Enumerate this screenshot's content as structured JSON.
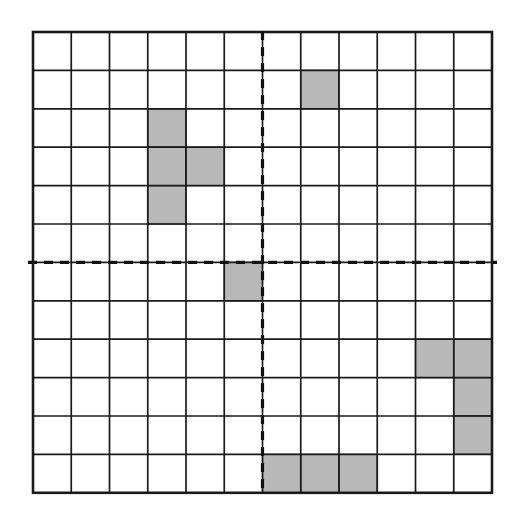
{
  "figure": {
    "type": "grid-diagram",
    "background_color": "#ffffff"
  },
  "grid": {
    "rows": 12,
    "columns": 12,
    "origin_x": 33,
    "origin_y": 32,
    "cell_width": 38.25,
    "cell_height": 38.4,
    "line_color": "#1a1a1a",
    "outer_line_width": 2.6,
    "inner_line_width": 1.7,
    "cell_fill_empty": "#ffffff",
    "cell_fill_shaded": "#b8b8b8",
    "shaded_cell_border_color": "#2a2a2a"
  },
  "axes": {
    "vertical": {
      "label": "vertical-dashed-axis",
      "after_column": 6,
      "color": "#111111",
      "width": 3.2,
      "dash_pattern": "9,7"
    },
    "horizontal": {
      "label": "horizontal-dashed-axis",
      "after_row": 6,
      "color": "#111111",
      "width": 3.2,
      "dash_pattern": "9,7"
    }
  },
  "chart_data": {
    "type": "heatmap",
    "title": "",
    "xlabel": "",
    "ylabel": "",
    "rows": 12,
    "columns": 12,
    "legend": [
      {
        "key": "shaded",
        "label": "Shaded cell",
        "color": "#b8b8b8",
        "value": 1
      },
      {
        "key": "empty",
        "label": "Empty cell",
        "color": "#ffffff",
        "value": 0
      }
    ],
    "shaded_cells": [
      {
        "row": 2,
        "col": 8
      },
      {
        "row": 3,
        "col": 4
      },
      {
        "row": 4,
        "col": 4
      },
      {
        "row": 4,
        "col": 5
      },
      {
        "row": 5,
        "col": 4
      },
      {
        "row": 7,
        "col": 6
      },
      {
        "row": 9,
        "col": 11
      },
      {
        "row": 9,
        "col": 12
      },
      {
        "row": 10,
        "col": 12
      },
      {
        "row": 11,
        "col": 12
      },
      {
        "row": 12,
        "col": 7
      },
      {
        "row": 12,
        "col": 8
      },
      {
        "row": 12,
        "col": 9
      }
    ],
    "shaded_count": 13,
    "total_cells": 144,
    "matrix": [
      [
        0,
        0,
        0,
        0,
        0,
        0,
        0,
        0,
        0,
        0,
        0,
        0
      ],
      [
        0,
        0,
        0,
        0,
        0,
        0,
        0,
        1,
        0,
        0,
        0,
        0
      ],
      [
        0,
        0,
        0,
        1,
        0,
        0,
        0,
        0,
        0,
        0,
        0,
        0
      ],
      [
        0,
        0,
        0,
        1,
        1,
        0,
        0,
        0,
        0,
        0,
        0,
        0
      ],
      [
        0,
        0,
        0,
        1,
        0,
        0,
        0,
        0,
        0,
        0,
        0,
        0
      ],
      [
        0,
        0,
        0,
        0,
        0,
        0,
        0,
        0,
        0,
        0,
        0,
        0
      ],
      [
        0,
        0,
        0,
        0,
        0,
        1,
        0,
        0,
        0,
        0,
        0,
        0
      ],
      [
        0,
        0,
        0,
        0,
        0,
        0,
        0,
        0,
        0,
        0,
        0,
        0
      ],
      [
        0,
        0,
        0,
        0,
        0,
        0,
        0,
        0,
        0,
        0,
        1,
        1
      ],
      [
        0,
        0,
        0,
        0,
        0,
        0,
        0,
        0,
        0,
        0,
        0,
        1
      ],
      [
        0,
        0,
        0,
        0,
        0,
        0,
        0,
        0,
        0,
        0,
        0,
        1
      ],
      [
        0,
        0,
        0,
        0,
        0,
        0,
        1,
        1,
        1,
        0,
        0,
        0
      ]
    ],
    "quadrant_divider_column": 6,
    "quadrant_divider_row": 6,
    "quadrant_counts": {
      "top_left": 4,
      "top_right": 1,
      "bottom_left": 0,
      "bottom_right": 8
    }
  }
}
